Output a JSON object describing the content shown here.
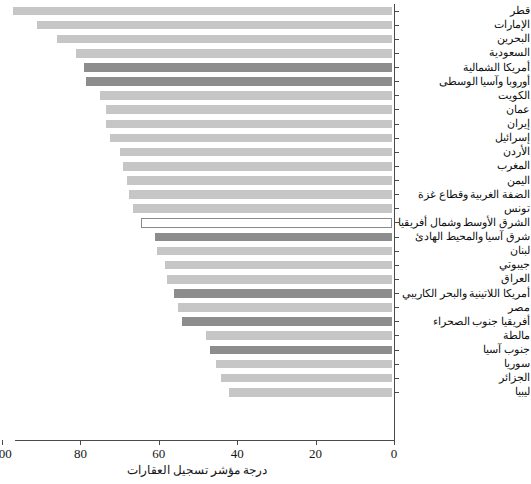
{
  "chart_data": {
    "type": "bar",
    "orientation": "horizontal",
    "title": "",
    "xlabel": "درجة مؤشر تسجيل العقارات",
    "ylabel": "",
    "xlim": [
      100,
      0
    ],
    "x_axis_reversed": true,
    "grid": false,
    "legend": null,
    "tick_labels": [
      "100",
      "80",
      "60",
      "40",
      "20",
      "0"
    ],
    "tick_values": [
      100,
      80,
      60,
      40,
      20,
      0
    ],
    "colors": {
      "country_bar": "#c6c6c6",
      "region_bar": "#8d8d8d",
      "highlight_bar_fill": "#ffffff",
      "highlight_bar_border": "#8a8a8a",
      "axis": "#4a4a4a",
      "text": "#101010",
      "background": "#ffffff"
    },
    "categories": [
      "قطر",
      "الإمارات",
      "البحرين",
      "السعودية",
      "أمريكا الشمالية",
      "أوروبا وآسيا الوسطى",
      "الكويت",
      "عمان",
      "إيران",
      "إسرائيل",
      "الأردن",
      "المغرب",
      "اليمن",
      "الضفة الغربية وقطاع غزة",
      "تونس",
      "الشرق الأوسط وشمال أفريقيا",
      "شرق آسيا والمحيط الهادئ",
      "لبنان",
      "جيبوتي",
      "العراق",
      "أمريكا اللاتينية والبحر الكاريبي",
      "مصر",
      "أفريقيا جنوب الصحراء",
      "مالطة",
      "جنوب آسيا",
      "سوريا",
      "الجزائر",
      "ليبيا"
    ],
    "values": [
      96.8,
      90.5,
      85.5,
      80.5,
      78.5,
      78.0,
      74.5,
      73.0,
      73.0,
      72.0,
      69.5,
      68.5,
      67.5,
      67.0,
      66.0,
      64.0,
      60.5,
      60.0,
      58.0,
      57.5,
      55.5,
      54.5,
      53.5,
      47.5,
      46.5,
      45.0,
      43.5,
      41.5
    ],
    "series_kinds": [
      "country",
      "country",
      "country",
      "country",
      "region",
      "region",
      "country",
      "country",
      "country",
      "country",
      "country",
      "country",
      "country",
      "country",
      "country",
      "highlight",
      "region",
      "country",
      "country",
      "country",
      "region",
      "country",
      "region",
      "country",
      "region",
      "country",
      "country",
      "country"
    ]
  }
}
